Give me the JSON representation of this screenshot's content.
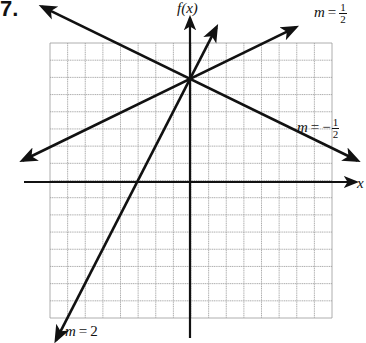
{
  "problem_number": "7.",
  "chart_data": {
    "type": "line",
    "title": "",
    "xlabel": "x",
    "ylabel": "f(x)",
    "grid": true,
    "grid_cells": {
      "columns": 16,
      "rows": 16
    },
    "xlim": [
      -8,
      8
    ],
    "ylim": [
      -8,
      8
    ],
    "axis_origin": [
      0,
      0
    ],
    "series": [
      {
        "name": "m = 1/2",
        "slope": 0.5,
        "y_intercept": 6,
        "label_position": "upper-right",
        "arrows": "both"
      },
      {
        "name": "m = -1/2",
        "slope": -0.5,
        "y_intercept": 6,
        "label_position": "right",
        "arrows": "both"
      },
      {
        "name": "m = 2",
        "slope": 2,
        "y_intercept": 6,
        "label_position": "bottom-left",
        "arrows": "both"
      }
    ],
    "annotations": [
      {
        "text": "m = 1/2"
      },
      {
        "text": "m = -1/2"
      },
      {
        "text": "m = 2"
      }
    ],
    "legend": "none (inline labels)"
  },
  "labels": {
    "y_axis": "f(x)",
    "x_axis": "x",
    "m_half": {
      "m": "m",
      "eq": "=",
      "num": "1",
      "den": "2"
    },
    "m_neg_half": {
      "m": "m",
      "eq": "=",
      "neg": "−",
      "num": "1",
      "den": "2"
    },
    "m_two": {
      "m": "m",
      "eq": "=",
      "value": "2"
    }
  },
  "colors": {
    "line": "#111111",
    "grid": "#9a9a9a",
    "background": "#ffffff"
  }
}
